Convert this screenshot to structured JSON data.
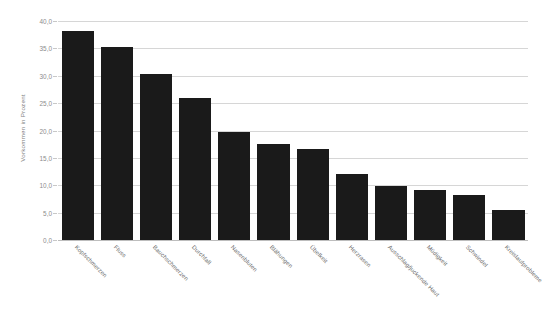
{
  "chart_data": {
    "type": "bar",
    "title": "",
    "subtitle": "",
    "xlabel": "",
    "ylabel": "Vorkommen in Prozent",
    "ylim": [
      0,
      40
    ],
    "grid": true,
    "legend": "none",
    "orientation": "vertical",
    "bar_color": "#1a1a1a",
    "grid_color": "#d6d6d6",
    "tick_label_format": "comma-decimal-one",
    "ytick_labels": [
      "40,0",
      "35,0",
      "30,0",
      "25,0",
      "20,0",
      "15,0",
      "10,0",
      "5,0",
      "0,0"
    ],
    "ytick_values": [
      40,
      35,
      30,
      25,
      20,
      15,
      10,
      5,
      0
    ],
    "categories": [
      "Kopfschmerzen",
      "Fluss",
      "Bauchschmerzen",
      "Durchfall",
      "Nasenbluten",
      "Blähungen",
      "Übelkeit",
      "Herzrasen",
      "Ausschlag/juckende Haut",
      "Müdigkeit",
      "Schwindel",
      "Kreislaufprobleme"
    ],
    "values": [
      38.2,
      35.3,
      30.3,
      26.0,
      19.8,
      17.6,
      16.7,
      12.0,
      9.8,
      9.2,
      8.3,
      5.5
    ]
  }
}
